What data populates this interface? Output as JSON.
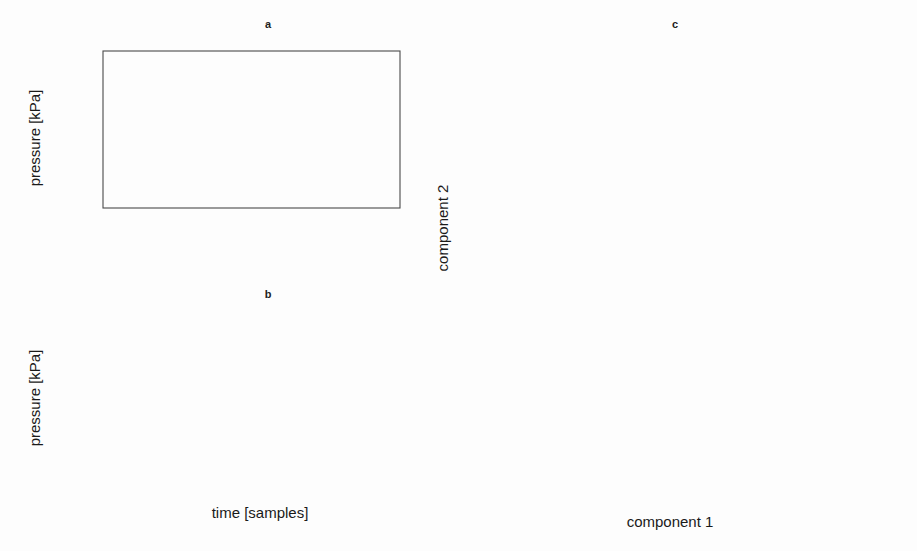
{
  "figure": {
    "width": 917,
    "height": 551,
    "background": "#fdfdfd",
    "ink_color": "#1a1a1a"
  },
  "panels": {
    "a": {
      "title": "a",
      "xlabel": "",
      "ylabel": "pressure [kPa]",
      "xticks": [
        0,
        200,
        400,
        600,
        800,
        1000
      ],
      "xtick_labels": [
        "0",
        "200",
        "400",
        "600",
        "800",
        "1000"
      ],
      "yticks": [
        1.0,
        1.1,
        1.2,
        1.3
      ],
      "ytick_labels": [
        "1.0",
        "1.1",
        "1.2",
        "1.3"
      ],
      "xlim": [
        -35,
        1045
      ],
      "ylim": [
        0.97,
        1.355
      ]
    },
    "b": {
      "title": "b",
      "xlabel": "time [samples]",
      "ylabel": "pressure [kPa]",
      "xticks": [
        0,
        200,
        400,
        600,
        800,
        1000
      ],
      "xtick_labels": [
        "0",
        "200",
        "400",
        "600",
        "800",
        "1000"
      ],
      "yticks": [
        1.1,
        1.2,
        1.3
      ],
      "ytick_labels": [
        "1.10",
        "1.20",
        "1.30"
      ],
      "xlim": [
        -35,
        1045
      ],
      "ylim": [
        1.075,
        1.375
      ]
    },
    "c": {
      "title": "c",
      "xlabel": "component 1",
      "ylabel": "component 2",
      "xticks": [
        -4,
        -3,
        -2,
        -1,
        0,
        1,
        2
      ],
      "xtick_labels": [
        "-4",
        "-3",
        "-2",
        "-1",
        "0",
        "1",
        "2"
      ],
      "yticks": [
        -1.0,
        -0.5,
        0.0,
        0.5,
        1.0,
        1.5
      ],
      "ytick_labels": [
        "-1.0",
        "-0.5",
        "0.0",
        "0.5",
        "1.0",
        "1.5"
      ],
      "xlim": [
        -4.85,
        2.45
      ],
      "ylim": [
        -1.12,
        1.92
      ]
    }
  },
  "chart_data": [
    {
      "type": "line",
      "panel": "a",
      "title": "a",
      "xlabel": "",
      "ylabel": "pressure [kPa]",
      "xlim": [
        -35,
        1045
      ],
      "ylim": [
        0.97,
        1.355
      ],
      "grid": false,
      "legend": null,
      "series": [
        {
          "name": "measured (plus markers)",
          "style": "plus-markers",
          "x": [
            0,
            25,
            50,
            75,
            100,
            150,
            200,
            250,
            300,
            350,
            400,
            450,
            500,
            550,
            600,
            650,
            680,
            710,
            740,
            770,
            800,
            830,
            860,
            880,
            900,
            915,
            930,
            940,
            950,
            965,
            980,
            1000
          ],
          "y": [
            1.306,
            1.305,
            1.303,
            1.3,
            1.297,
            1.292,
            1.287,
            1.282,
            1.277,
            1.272,
            1.267,
            1.262,
            1.257,
            1.253,
            1.249,
            1.245,
            1.243,
            1.242,
            1.241,
            1.241,
            1.243,
            1.252,
            1.272,
            1.292,
            1.32,
            1.336,
            1.341,
            1.338,
            1.33,
            1.3,
            1.255,
            1.205
          ]
        },
        {
          "name": "model solid line",
          "style": "solid",
          "x": [
            0,
            50,
            100,
            150,
            200,
            250,
            300,
            350,
            400,
            450,
            500,
            550,
            600,
            650,
            700,
            730,
            760,
            790,
            820,
            850,
            880,
            900,
            920,
            935,
            950,
            965,
            980,
            1000
          ],
          "y": [
            1.292,
            1.288,
            1.284,
            1.279,
            1.274,
            1.269,
            1.263,
            1.256,
            1.248,
            1.237,
            1.221,
            1.199,
            1.171,
            1.141,
            1.117,
            1.11,
            1.11,
            1.122,
            1.155,
            1.215,
            1.29,
            1.325,
            1.34,
            1.338,
            1.325,
            1.295,
            1.255,
            1.205
          ]
        },
        {
          "name": "model dashed line",
          "style": "dashed",
          "x": [
            0,
            50,
            100,
            150,
            200,
            250,
            300,
            350,
            400,
            450,
            500,
            550,
            600,
            640,
            680,
            710,
            740,
            760,
            780,
            800,
            820,
            840,
            860,
            880,
            900,
            920,
            935,
            950,
            965,
            980,
            1000
          ],
          "y": [
            1.266,
            1.264,
            1.262,
            1.259,
            1.256,
            1.252,
            1.247,
            1.241,
            1.232,
            1.219,
            1.198,
            1.166,
            1.122,
            1.08,
            1.033,
            1.005,
            0.993,
            0.992,
            0.999,
            1.02,
            1.06,
            1.12,
            1.195,
            1.27,
            1.322,
            1.34,
            1.338,
            1.325,
            1.295,
            1.255,
            1.205
          ]
        }
      ]
    },
    {
      "type": "line",
      "panel": "b",
      "title": "b",
      "xlabel": "time [samples]",
      "ylabel": "pressure [kPa]",
      "xlim": [
        -35,
        1045
      ],
      "ylim": [
        1.075,
        1.375
      ],
      "grid": false,
      "legend": null,
      "series": [
        {
          "name": "measured (plus markers)",
          "style": "plus-markers",
          "x": [
            0,
            25,
            50,
            75,
            100,
            150,
            200,
            250,
            300,
            350,
            400,
            450,
            500,
            550,
            600,
            640,
            680,
            710,
            740,
            760,
            780,
            800,
            830,
            860,
            890,
            910,
            925,
            935,
            945,
            960,
            975,
            1000
          ],
          "y": [
            1.323,
            1.32,
            1.317,
            1.314,
            1.311,
            1.305,
            1.299,
            1.293,
            1.287,
            1.28,
            1.272,
            1.262,
            1.25,
            1.234,
            1.212,
            1.19,
            1.162,
            1.135,
            1.11,
            1.098,
            1.094,
            1.1,
            1.128,
            1.18,
            1.26,
            1.32,
            1.355,
            1.362,
            1.358,
            1.33,
            1.28,
            1.198
          ]
        },
        {
          "name": "model solid line",
          "style": "solid",
          "x": [
            0,
            50,
            100,
            150,
            200,
            250,
            300,
            350,
            400,
            450,
            500,
            550,
            600,
            640,
            680,
            710,
            740,
            760,
            780,
            800,
            830,
            860,
            890,
            910,
            925,
            940,
            955,
            970,
            985,
            1000
          ],
          "y": [
            1.285,
            1.282,
            1.279,
            1.275,
            1.271,
            1.266,
            1.261,
            1.254,
            1.246,
            1.236,
            1.223,
            1.208,
            1.188,
            1.17,
            1.147,
            1.128,
            1.112,
            1.106,
            1.105,
            1.11,
            1.135,
            1.182,
            1.255,
            1.31,
            1.336,
            1.338,
            1.32,
            1.285,
            1.24,
            1.198
          ]
        },
        {
          "name": "model dashed line",
          "style": "dashed",
          "x": [
            0,
            50,
            100,
            150,
            200,
            250,
            300,
            350,
            400,
            450,
            500,
            550,
            600,
            640,
            680,
            710,
            740,
            760,
            780,
            800,
            830,
            860,
            890,
            905,
            920,
            935,
            950,
            965,
            980,
            1000
          ],
          "y": [
            1.249,
            1.247,
            1.245,
            1.242,
            1.239,
            1.235,
            1.231,
            1.226,
            1.219,
            1.211,
            1.2,
            1.187,
            1.17,
            1.154,
            1.133,
            1.117,
            1.102,
            1.097,
            1.096,
            1.101,
            1.126,
            1.172,
            1.238,
            1.27,
            1.288,
            1.29,
            1.282,
            1.262,
            1.234,
            1.198
          ]
        }
      ]
    },
    {
      "type": "scatter",
      "panel": "c",
      "title": "c",
      "xlabel": "component 1",
      "ylabel": "component 2",
      "xlim": [
        -4.85,
        2.45
      ],
      "ylim": [
        -1.12,
        1.92
      ],
      "grid": false,
      "legend_position": "top-right",
      "series": [
        {
          "name": "nl2nl",
          "marker": "open-square",
          "points": [
            [
              2.1,
              1.82
            ],
            [
              1.52,
              0.77
            ],
            [
              1.42,
              0.39
            ],
            [
              2.14,
              -0.01
            ],
            [
              1.33,
              -0.06
            ],
            [
              1.37,
              -0.38
            ],
            [
              1.22,
              -0.77
            ],
            [
              1.45,
              -0.77
            ]
          ]
        },
        {
          "name": "l2nl",
          "marker": "filled-square",
          "points": [
            [
              -0.44,
              1.55
            ],
            [
              1.07,
              0.65
            ],
            [
              -0.46,
              0.29
            ],
            [
              -0.46,
              0.25
            ],
            [
              0.62,
              0.02
            ],
            [
              0.42,
              -0.07
            ],
            [
              0.89,
              -0.5
            ],
            [
              0.95,
              -0.5
            ],
            [
              0.83,
              -0.57
            ],
            [
              0.7,
              -0.69
            ],
            [
              0.82,
              -0.95
            ]
          ]
        },
        {
          "name": "l2s",
          "marker": "open-triangle",
          "points": [
            [
              -3.02,
              1.53
            ],
            [
              -1.92,
              1.1
            ],
            [
              -1.37,
              0.32
            ],
            [
              -1.1,
              -0.07
            ],
            [
              -2.66,
              -0.36
            ],
            [
              -1.32,
              -0.47
            ],
            [
              -1.22,
              -0.51
            ],
            [
              -4.45,
              -0.55
            ],
            [
              -0.02,
              -0.85
            ]
          ]
        }
      ]
    }
  ],
  "legend_c": {
    "entries": [
      {
        "label": "nl2nl",
        "marker": "open-square"
      },
      {
        "label": "l2nl",
        "marker": "filled-square"
      },
      {
        "label": "l2s",
        "marker": "open-triangle"
      }
    ]
  }
}
